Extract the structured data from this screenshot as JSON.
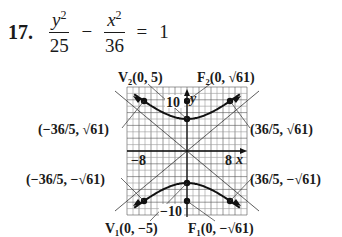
{
  "problem": {
    "number": "17.",
    "term1_num": "y",
    "term1_exp": "2",
    "term1_den": "25",
    "minus": "−",
    "term2_num": "x",
    "term2_exp": "2",
    "term2_den": "36",
    "equals": "=",
    "rhs": "1"
  },
  "graph": {
    "x_tick_neg": "−8",
    "x_tick_pos": "8",
    "y_tick_pos": "10",
    "y_tick_neg": "−10",
    "x_axis_label": "x",
    "y_axis_label": "y",
    "labels": {
      "v2": "V₂(0, 5)",
      "f2": "F₂(0, √61)",
      "v1": "V₁(0, −5)",
      "f1": "F₁(0, −√61)",
      "p_ul": "(−36/5, √61)",
      "p_ur": "(36/5, √61)",
      "p_ll": "(−36/5, −√61)",
      "p_lr": "(36/5, −√61)"
    }
  },
  "chart_data": {
    "type": "line",
    "xlabel": "x",
    "ylabel": "y",
    "xlim": [
      -10,
      10
    ],
    "ylim": [
      -10,
      10
    ],
    "x_ticks_labeled": [
      -8,
      8
    ],
    "y_ticks_labeled": [
      10,
      -10
    ],
    "grid": true,
    "series": [
      {
        "name": "upper branch",
        "equation": "y = 5*sqrt(1 + x^2/36)"
      },
      {
        "name": "lower branch",
        "equation": "y = -5*sqrt(1 + x^2/36)"
      }
    ],
    "points": [
      {
        "label": "V2",
        "x": 0,
        "y": 5
      },
      {
        "label": "F2",
        "x": 0,
        "y": 7.81
      },
      {
        "label": "V1",
        "x": 0,
        "y": -5
      },
      {
        "label": "F1",
        "x": 0,
        "y": -7.81
      },
      {
        "label": "(36/5, √61)",
        "x": 7.2,
        "y": 7.81
      },
      {
        "label": "(−36/5, √61)",
        "x": -7.2,
        "y": 7.81
      },
      {
        "label": "(36/5, −√61)",
        "x": 7.2,
        "y": -7.81
      },
      {
        "label": "(−36/5, −√61)",
        "x": -7.2,
        "y": -7.81
      }
    ]
  }
}
